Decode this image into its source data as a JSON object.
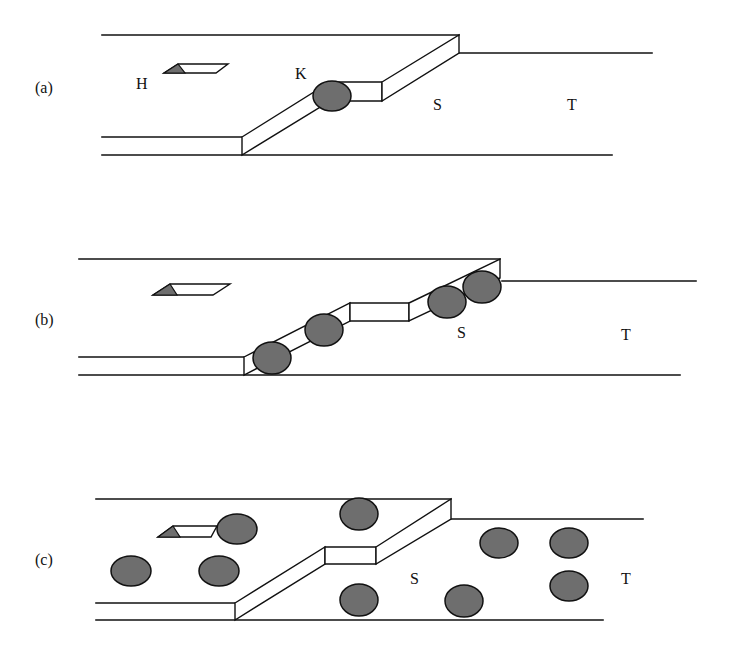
{
  "figure": {
    "colors": {
      "stroke": "#111111",
      "particle_fill": "#6e6e6e",
      "background": "#ffffff"
    },
    "panels": [
      {
        "id": "a",
        "label": "(a)",
        "label_pos": [
          35,
          93
        ],
        "region_labels": [
          {
            "text": "H",
            "pos": [
              136,
              89
            ]
          },
          {
            "text": "K",
            "pos": [
              295,
              79
            ]
          },
          {
            "text": "S",
            "pos": [
              433,
              110
            ]
          },
          {
            "text": "T",
            "pos": [
              567,
              110
            ]
          }
        ],
        "lines": [
          [
            [
              102,
              35
            ],
            [
              459,
              35
            ]
          ],
          [
            [
              459,
              53
            ],
            [
              652,
              53
            ]
          ],
          [
            [
              102,
              137
            ],
            [
              242,
              137
            ]
          ],
          [
            [
              102,
              155
            ],
            [
              612,
              155
            ]
          ]
        ],
        "step_faces": [
          [
            [
              242,
              137
            ],
            [
              330,
              82
            ],
            [
              330,
              101
            ],
            [
              242,
              155
            ]
          ],
          [
            [
              330,
              82
            ],
            [
              382,
              82
            ],
            [
              382,
              101
            ],
            [
              330,
              101
            ]
          ],
          [
            [
              382,
              82
            ],
            [
              459,
              35
            ],
            [
              459,
              53
            ],
            [
              382,
              101
            ]
          ]
        ],
        "ledge": {
          "para": [
            [
              178,
              64
            ],
            [
              228,
              64
            ],
            [
              216,
              73
            ],
            [
              164,
              73
            ]
          ],
          "tri": [
            [
              164,
              73
            ],
            [
              178,
              64
            ],
            [
              185,
              73
            ]
          ]
        },
        "particles": [
          {
            "cx": 332,
            "cy": 96,
            "rx": 19,
            "ry": 15
          }
        ]
      },
      {
        "id": "b",
        "label": "(b)",
        "label_pos": [
          35,
          325
        ],
        "region_labels": [
          {
            "text": "S",
            "pos": [
              457,
              338
            ]
          },
          {
            "text": "T",
            "pos": [
              621,
              340
            ]
          }
        ],
        "lines": [
          [
            [
              79,
              259
            ],
            [
              500,
              259
            ]
          ],
          [
            [
              502,
              281
            ],
            [
              696,
              281
            ]
          ],
          [
            [
              79,
              357
            ],
            [
              244,
              357
            ]
          ],
          [
            [
              79,
              375
            ],
            [
              680,
              375
            ]
          ]
        ],
        "step_faces": [
          [
            [
              244,
              357
            ],
            [
              350,
              303
            ],
            [
              350,
              321
            ],
            [
              244,
              375
            ]
          ],
          [
            [
              350,
              303
            ],
            [
              409,
              303
            ],
            [
              409,
              321
            ],
            [
              350,
              321
            ]
          ],
          [
            [
              409,
              303
            ],
            [
              500,
              259
            ],
            [
              500,
              278
            ],
            [
              409,
              321
            ]
          ]
        ],
        "ledge": {
          "para": [
            [
              170,
              284
            ],
            [
              230,
              284
            ],
            [
              213,
              295
            ],
            [
              153,
              295
            ]
          ],
          "tri": [
            [
              153,
              295
            ],
            [
              170,
              284
            ],
            [
              177,
              295
            ]
          ]
        },
        "particles": [
          {
            "cx": 272,
            "cy": 358,
            "rx": 19,
            "ry": 16
          },
          {
            "cx": 324,
            "cy": 330,
            "rx": 19,
            "ry": 16
          },
          {
            "cx": 447,
            "cy": 302,
            "rx": 19,
            "ry": 16
          },
          {
            "cx": 482,
            "cy": 287,
            "rx": 19,
            "ry": 16
          }
        ]
      },
      {
        "id": "c",
        "label": "(c)",
        "label_pos": [
          35,
          565
        ],
        "region_labels": [
          {
            "text": "S",
            "pos": [
              410,
              584
            ]
          },
          {
            "text": "T",
            "pos": [
              621,
              584
            ]
          }
        ],
        "lines": [
          [
            [
              96,
              499
            ],
            [
              451,
              499
            ]
          ],
          [
            [
              451,
              519
            ],
            [
              643,
              519
            ]
          ],
          [
            [
              96,
              603
            ],
            [
              235,
              603
            ]
          ],
          [
            [
              96,
              620
            ],
            [
              603,
              620
            ]
          ]
        ],
        "step_faces": [
          [
            [
              235,
              603
            ],
            [
              325,
              547
            ],
            [
              325,
              564
            ],
            [
              235,
              620
            ]
          ],
          [
            [
              325,
              547
            ],
            [
              376,
              547
            ],
            [
              376,
              564
            ],
            [
              325,
              564
            ]
          ],
          [
            [
              376,
              547
            ],
            [
              451,
              499
            ],
            [
              451,
              519
            ],
            [
              376,
              564
            ]
          ]
        ],
        "ledge": {
          "para": [
            [
              173,
              526
            ],
            [
              217,
              526
            ],
            [
              211,
              537
            ],
            [
              158,
              537
            ]
          ],
          "tri": [
            [
              158,
              537
            ],
            [
              173,
              526
            ],
            [
              180,
              537
            ]
          ]
        },
        "particles": [
          {
            "cx": 237,
            "cy": 529,
            "rx": 20,
            "ry": 15
          },
          {
            "cx": 359,
            "cy": 514,
            "rx": 19,
            "ry": 16
          },
          {
            "cx": 131,
            "cy": 571,
            "rx": 20,
            "ry": 15
          },
          {
            "cx": 219,
            "cy": 571,
            "rx": 20,
            "ry": 15
          },
          {
            "cx": 359,
            "cy": 600,
            "rx": 19,
            "ry": 16
          },
          {
            "cx": 464,
            "cy": 601,
            "rx": 19,
            "ry": 16
          },
          {
            "cx": 499,
            "cy": 543,
            "rx": 19,
            "ry": 15
          },
          {
            "cx": 569,
            "cy": 543,
            "rx": 19,
            "ry": 15
          },
          {
            "cx": 569,
            "cy": 586,
            "rx": 19,
            "ry": 15
          }
        ]
      }
    ]
  }
}
